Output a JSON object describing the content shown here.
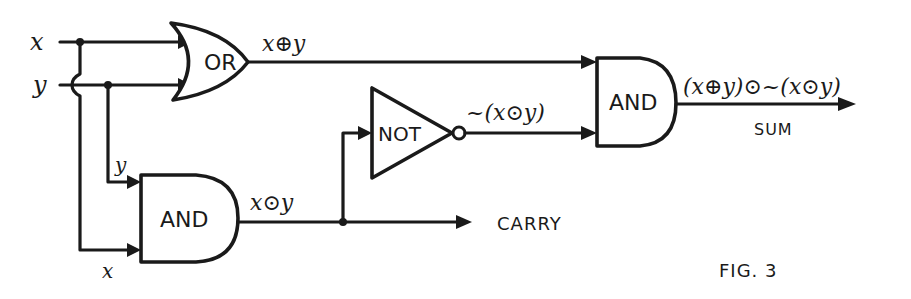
{
  "figure": {
    "caption": "FIG. 3"
  },
  "inputs": {
    "x": "x",
    "y": "y",
    "and_y": "y",
    "and_x": "x"
  },
  "gates": {
    "or": "OR",
    "and_carry": "AND",
    "not": "NOT",
    "and_sum": "AND"
  },
  "signals": {
    "xor": "x⊕y",
    "xand": "x⊙y",
    "not_xand": "~(x⊙y)",
    "sum_expr": "(x⊕y)⊙~(x⊙y)"
  },
  "outputs": {
    "sum": "SUM",
    "carry": "CARRY"
  },
  "colors": {
    "ink": "#1a1a1a",
    "paper": "#ffffff"
  }
}
